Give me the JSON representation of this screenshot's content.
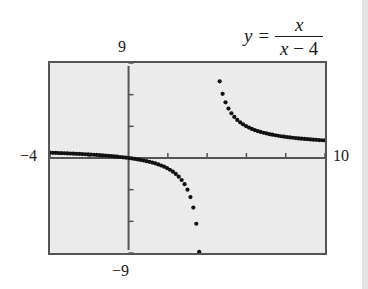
{
  "equation": {
    "lhs": "y",
    "eq": "=",
    "numerator": "x",
    "denominator_var": "x",
    "denominator_rest": " − 4"
  },
  "window_labels": {
    "ymax": "9",
    "ymin": "−9",
    "xmin": "−4",
    "xmax": "10"
  },
  "colors": {
    "plot_bg": "#ebebeb",
    "axis": "#555555",
    "dot": "#111111",
    "frame": "#555555"
  },
  "chart_data": {
    "type": "scatter",
    "xlabel": "",
    "ylabel": "",
    "xlim": [
      -4,
      10
    ],
    "ylim": [
      -9,
      9
    ],
    "xscale": 2,
    "yscale": 3,
    "grid": false,
    "function": "x/(x-4)",
    "x_step": 0.25,
    "sample_points": [
      {
        "x": -4,
        "y": 0.5
      },
      {
        "x": -2,
        "y": 0.333
      },
      {
        "x": 0,
        "y": 0
      },
      {
        "x": 2,
        "y": -1
      },
      {
        "x": 3,
        "y": -3
      },
      {
        "x": 3.5,
        "y": -7
      },
      {
        "x": 4.5,
        "y": 9
      },
      {
        "x": 5,
        "y": 5
      },
      {
        "x": 6,
        "y": 3
      },
      {
        "x": 8,
        "y": 2
      },
      {
        "x": 10,
        "y": 1.667
      }
    ]
  }
}
